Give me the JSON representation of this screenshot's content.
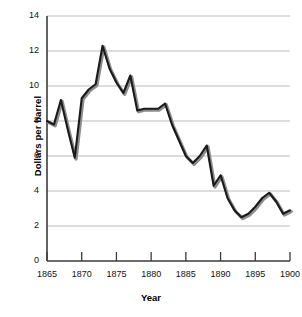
{
  "chart_data": {
    "type": "line",
    "title": "",
    "xlabel": "Year",
    "ylabel": "Dollars per barrel",
    "xlim": [
      1865,
      1900
    ],
    "ylim": [
      0,
      14
    ],
    "grid": true,
    "legend": "none",
    "xticks": [
      1865,
      1870,
      1875,
      1880,
      1885,
      1890,
      1895,
      1900
    ],
    "yticks": [
      0,
      2,
      4,
      6,
      8,
      10,
      12,
      14
    ],
    "x": [
      1865,
      1866,
      1867,
      1868,
      1869,
      1870,
      1871,
      1872,
      1873,
      1874,
      1875,
      1876,
      1877,
      1878,
      1879,
      1880,
      1881,
      1882,
      1883,
      1884,
      1885,
      1886,
      1887,
      1888,
      1889,
      1890,
      1891,
      1892,
      1893,
      1894,
      1895,
      1896,
      1897,
      1898,
      1899,
      1900
    ],
    "values": [
      8.0,
      7.8,
      9.2,
      7.5,
      5.9,
      9.3,
      9.8,
      10.1,
      12.3,
      11.0,
      10.2,
      9.6,
      10.6,
      8.6,
      8.7,
      8.7,
      8.7,
      9.0,
      7.8,
      6.9,
      6.0,
      5.6,
      6.0,
      6.6,
      4.3,
      4.9,
      3.6,
      2.9,
      2.5,
      2.7,
      3.1,
      3.6,
      3.9,
      3.4,
      2.7,
      2.9
    ],
    "series_name": "Dollars per barrel",
    "line_color": "#1a1a1a",
    "shadow_color": "#8c8c8c",
    "grid_color": "#b3b3b3",
    "axis_color": "#3b3b3b"
  },
  "axes": {
    "y_title": "Dollars per barrel",
    "x_title": "Year",
    "y_tick_labels": [
      "14",
      "12",
      "10",
      "8",
      "6",
      "4",
      "2",
      "0"
    ],
    "x_tick_labels": [
      "1865",
      "1870",
      "1875",
      "1880",
      "1885",
      "1890",
      "1895",
      "1900"
    ]
  }
}
